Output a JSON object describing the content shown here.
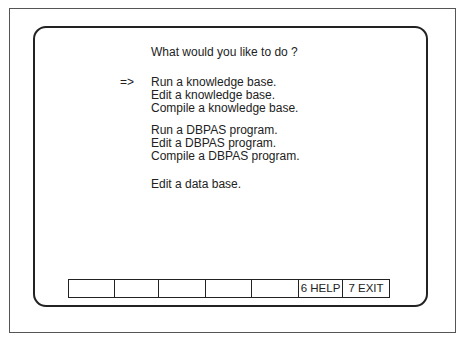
{
  "prompt": "What would you like to do ?",
  "cursor": "=>",
  "menu": {
    "groups": [
      [
        "Run a knowledge base.",
        "Edit a knowledge base.",
        "Compile a knowledge base."
      ],
      [
        "Run a DBPAS program.",
        "Edit a DBPAS program.",
        "Compile a DBPAS program."
      ],
      [
        "Edit a data base."
      ]
    ],
    "selected": "Run a knowledge base."
  },
  "function_keys": [
    {
      "label": ""
    },
    {
      "label": ""
    },
    {
      "label": ""
    },
    {
      "label": ""
    },
    {
      "label": ""
    },
    {
      "label": "6 HELP"
    },
    {
      "label": "7 EXIT"
    }
  ]
}
